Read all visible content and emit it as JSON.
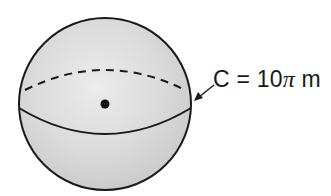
{
  "diagram": {
    "type": "sphere",
    "label": {
      "variable": "C",
      "equals": "=",
      "coefficient": "10",
      "symbol": "π",
      "unit": "m",
      "full_text": "C = 10π m"
    },
    "colors": {
      "sphere_fill": "#d6d6d6",
      "stroke": "#1a1a1a",
      "background": "#ffffff"
    },
    "elements": [
      "sphere outline",
      "dashed back equator",
      "solid front equator",
      "center point",
      "arrow to circumference"
    ]
  }
}
